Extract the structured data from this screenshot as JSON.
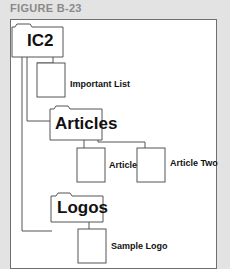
{
  "figure": {
    "label": "FIGURE B-23"
  },
  "tree": {
    "root": {
      "name": "IC2",
      "type": "folder"
    },
    "children": [
      {
        "name": "Important List",
        "type": "file"
      },
      {
        "name": "Articles",
        "type": "folder",
        "children": [
          {
            "name": "Article",
            "type": "file"
          },
          {
            "name": "Article Two",
            "type": "file"
          }
        ]
      },
      {
        "name": "Logos",
        "type": "folder",
        "children": [
          {
            "name": "Sample Logo",
            "type": "file"
          }
        ]
      }
    ]
  },
  "colors": {
    "background": "#e3e3e3",
    "frame": "#ffffff",
    "stroke": "#555555",
    "label": "#8a8a8a"
  }
}
